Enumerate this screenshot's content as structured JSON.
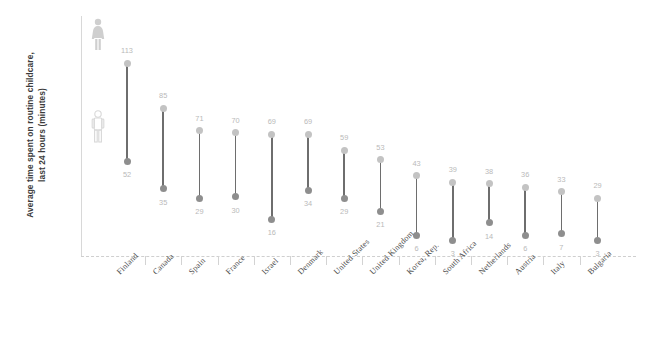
{
  "chart_data": {
    "type": "dumbbell",
    "title": "",
    "xlabel": "",
    "ylabel": "Average time spent on routine childcare, last 24 hours (minutes)",
    "ylabel_line1": "Average time spent on routine childcare,",
    "ylabel_line2": "last 24 hours (minutes)",
    "ylim": [
      0,
      120
    ],
    "grid": false,
    "legend_position": "inside-left",
    "categories": [
      "Finland",
      "Canada",
      "Spain",
      "France",
      "Israel",
      "Denmark",
      "United States",
      "United Kingdom",
      "Korea, Rep.",
      "South Africa",
      "Netherlands",
      "Austria",
      "Italy",
      "Bulgaria"
    ],
    "series": [
      {
        "name": "Women",
        "icon": "female-figure-icon",
        "color": "#c3c3c3",
        "values": [
          113,
          85,
          71,
          70,
          69,
          69,
          59,
          53,
          43,
          39,
          38,
          36,
          33,
          29
        ]
      },
      {
        "name": "Men",
        "icon": "male-figure-icon",
        "color": "#8e8e8e",
        "values": [
          52,
          35,
          29,
          30,
          16,
          34,
          29,
          21,
          6,
          3,
          14,
          6,
          7,
          3
        ]
      }
    ]
  },
  "style": {
    "connector_color": "#6e6e6e",
    "value_label_color": "#b9b9b9",
    "axis_color": "#d3d3d3",
    "category_label_color": "#4a4a4a",
    "background": "#ffffff"
  }
}
